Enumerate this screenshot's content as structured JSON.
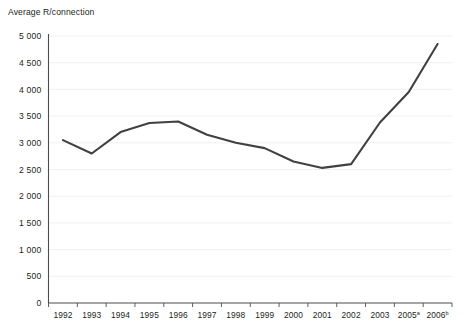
{
  "chart_data": {
    "type": "line",
    "title": "Average R/connection",
    "xlabel": "",
    "ylabel": "Average R/connection",
    "ylim": [
      0,
      5000
    ],
    "grid": true,
    "legend": "none",
    "categories": [
      "1992",
      "1993",
      "1994",
      "1995",
      "1996",
      "1997",
      "1998",
      "1999",
      "2000",
      "2001",
      "2002",
      "2003",
      "2005",
      "2006"
    ],
    "category_labels": [
      {
        "text": "1992",
        "sup": ""
      },
      {
        "text": "1993",
        "sup": ""
      },
      {
        "text": "1994",
        "sup": ""
      },
      {
        "text": "1995",
        "sup": ""
      },
      {
        "text": "1996",
        "sup": ""
      },
      {
        "text": "1997",
        "sup": ""
      },
      {
        "text": "1998",
        "sup": ""
      },
      {
        "text": "1999",
        "sup": ""
      },
      {
        "text": "2000",
        "sup": ""
      },
      {
        "text": "2001",
        "sup": ""
      },
      {
        "text": "2002",
        "sup": ""
      },
      {
        "text": "2003",
        "sup": ""
      },
      {
        "text": "2005",
        "sup": "a"
      },
      {
        "text": "2006",
        "sup": "b"
      }
    ],
    "values": [
      3050,
      2800,
      3200,
      3370,
      3400,
      3150,
      3000,
      2900,
      2650,
      2530,
      2600,
      3380,
      3950,
      4850
    ],
    "ytick_labels": [
      "0",
      "500",
      "1 000",
      "1 500",
      "2 000",
      "2 500",
      "3 000",
      "3 500",
      "4 000",
      "4 500",
      "5 000"
    ],
    "ytick_values": [
      0,
      500,
      1000,
      1500,
      2000,
      2500,
      3000,
      3500,
      4000,
      4500,
      5000
    ],
    "series": [
      {
        "name": "Average R/connection",
        "color": "#414042",
        "values": [
          3050,
          2800,
          3200,
          3370,
          3400,
          3150,
          3000,
          2900,
          2650,
          2530,
          2600,
          3380,
          3950,
          4850
        ]
      }
    ]
  },
  "colors": {
    "line": "#414042",
    "grid": "#ececed",
    "axis": "#4d4d4f",
    "text": "#231f20",
    "background": "#ffffff"
  }
}
